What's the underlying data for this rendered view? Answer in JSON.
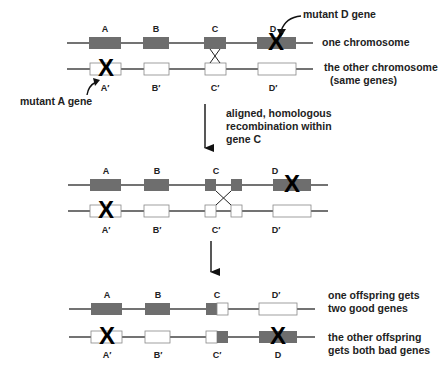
{
  "colors": {
    "gene_normal": "#6e6e6e",
    "gene_alt": "#ffffff",
    "line": "#444444",
    "mutation_mark": "#000000"
  },
  "section1": {
    "top_labels": [
      "A",
      "B",
      "C",
      "D"
    ],
    "bottom_labels": [
      "A′",
      "B′",
      "C′",
      "D′"
    ],
    "annotations": {
      "mutant_d": "mutant D gene",
      "mutant_a": "mutant A gene",
      "one_chromosome": "one chromosome",
      "other_chromosome_line1": "the other chromosome",
      "other_chromosome_line2": "(same genes)"
    },
    "mutation_mark": "X"
  },
  "arrow1": {
    "text_line1": "aligned, homologous",
    "text_line2": "recombination within",
    "text_line3": "gene C"
  },
  "section2": {
    "top_labels": [
      "A",
      "B",
      "C",
      "D"
    ],
    "bottom_labels": [
      "A′",
      "B′",
      "C′",
      "D′"
    ],
    "mutation_mark": "X"
  },
  "section3": {
    "top_labels": [
      "A",
      "B",
      "C",
      "D′"
    ],
    "bottom_labels": [
      "A′",
      "B′",
      "C′",
      "D"
    ],
    "annotations": {
      "offspring1_line1": "one offspring gets",
      "offspring1_line2": "two good genes",
      "offspring2_line1": "the other offspring",
      "offspring2_line2": "gets both bad genes"
    },
    "mutation_mark": "X"
  }
}
